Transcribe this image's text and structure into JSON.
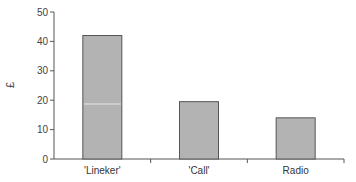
{
  "chart_data": {
    "type": "bar",
    "title": "",
    "xlabel": "",
    "ylabel": "£",
    "categories": [
      "'Lineker'",
      "'Call'",
      "Radio"
    ],
    "values": [
      42,
      19.5,
      14
    ],
    "ylim": [
      0,
      50
    ],
    "yticks": [
      0,
      10,
      20,
      30,
      40,
      50
    ],
    "grid": false,
    "legend": null,
    "bar_color": "#b3b3b3",
    "bar_edge_color": "#555555"
  }
}
